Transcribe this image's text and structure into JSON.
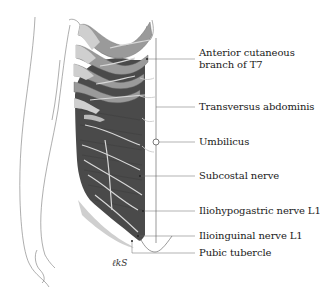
{
  "diagram": {
    "type": "anatomical-illustration",
    "colors": {
      "muscle_dark": "#4a4a4a",
      "rib_mid": "#9a9a9a",
      "rib_light": "#cfcfcf",
      "nerve": "#d8d8d8",
      "line": "#555555"
    },
    "labels": [
      {
        "id": "t7",
        "line1": "Anterior cutaneous",
        "line2": "branch of T7",
        "y": 59
      },
      {
        "id": "transversus",
        "line1": "Transversus abdominis",
        "y": 107
      },
      {
        "id": "umbilicus",
        "line1": "Umbilicus",
        "y": 142
      },
      {
        "id": "subcostal",
        "line1": "Subcostal nerve",
        "y": 176
      },
      {
        "id": "iliohypogastric",
        "line1": "Iliohypogastric nerve L1",
        "y": 211
      },
      {
        "id": "ilioinguinal",
        "line1": "Ilioinguinal nerve L1",
        "y": 236
      },
      {
        "id": "pubic",
        "line1": "Pubic tubercle",
        "y": 253
      }
    ],
    "signature": "ℓkS"
  }
}
